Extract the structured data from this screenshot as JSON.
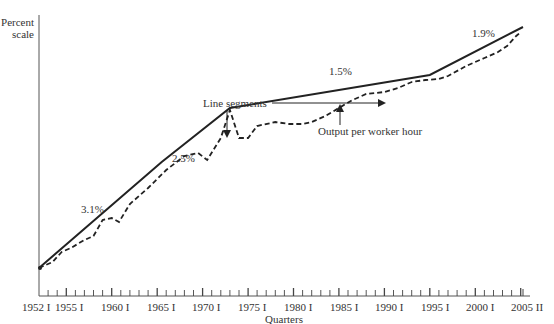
{
  "chart_data": {
    "type": "line",
    "title": "",
    "ylabel": "Percent scale",
    "xlabel": "Quarters",
    "grid": false,
    "legend": "none (inline annotations)",
    "x_tick_labels": [
      "1952 I",
      "1955 I",
      "1960 I",
      "1965 I",
      "1970 I",
      "1975 I",
      "1980 I",
      "1985 I",
      "1990 I",
      "1995 I",
      "2000 I",
      "2005 II"
    ],
    "x_range": [
      "1952 I",
      "2005 II"
    ],
    "series": [
      {
        "name": "Line segments",
        "style": "solid",
        "points": [
          {
            "x": 1952.0,
            "y_px": 268
          },
          {
            "x": 1965.5,
            "y_px": 162
          },
          {
            "x": 1973.0,
            "y_px": 108
          },
          {
            "x": 1995.0,
            "y_px": 75
          },
          {
            "x": 2005.25,
            "y_px": 27
          }
        ],
        "segment_growth_rates": [
          "3.1%",
          "2.5%",
          "1.5%",
          "1.9%"
        ]
      },
      {
        "name": "Output per worker hour",
        "style": "dashed",
        "points": [
          {
            "x": 1952.0,
            "y_px": 268
          },
          {
            "x": 1953.5,
            "y_px": 262
          },
          {
            "x": 1954.5,
            "y_px": 252
          },
          {
            "x": 1955.5,
            "y_px": 248
          },
          {
            "x": 1957.0,
            "y_px": 240
          },
          {
            "x": 1958.0,
            "y_px": 236
          },
          {
            "x": 1959.0,
            "y_px": 220
          },
          {
            "x": 1960.0,
            "y_px": 218
          },
          {
            "x": 1960.8,
            "y_px": 222
          },
          {
            "x": 1962.0,
            "y_px": 204
          },
          {
            "x": 1964.0,
            "y_px": 188
          },
          {
            "x": 1966.0,
            "y_px": 170
          },
          {
            "x": 1968.0,
            "y_px": 156
          },
          {
            "x": 1969.5,
            "y_px": 153
          },
          {
            "x": 1970.5,
            "y_px": 160
          },
          {
            "x": 1972.0,
            "y_px": 138
          },
          {
            "x": 1973.0,
            "y_px": 110
          },
          {
            "x": 1974.0,
            "y_px": 138
          },
          {
            "x": 1975.0,
            "y_px": 138
          },
          {
            "x": 1976.0,
            "y_px": 126
          },
          {
            "x": 1978.0,
            "y_px": 122
          },
          {
            "x": 1979.5,
            "y_px": 124
          },
          {
            "x": 1981.0,
            "y_px": 124
          },
          {
            "x": 1982.0,
            "y_px": 122
          },
          {
            "x": 1983.5,
            "y_px": 116
          },
          {
            "x": 1985.0,
            "y_px": 108
          },
          {
            "x": 1986.5,
            "y_px": 100
          },
          {
            "x": 1988.0,
            "y_px": 94
          },
          {
            "x": 1990.0,
            "y_px": 92
          },
          {
            "x": 1991.5,
            "y_px": 88
          },
          {
            "x": 1993.0,
            "y_px": 82
          },
          {
            "x": 1994.5,
            "y_px": 80
          },
          {
            "x": 1996.0,
            "y_px": 79
          },
          {
            "x": 1997.0,
            "y_px": 76
          },
          {
            "x": 1999.0,
            "y_px": 66
          },
          {
            "x": 2001.0,
            "y_px": 58
          },
          {
            "x": 2002.5,
            "y_px": 52
          },
          {
            "x": 2003.5,
            "y_px": 46
          },
          {
            "x": 2004.5,
            "y_px": 36
          },
          {
            "x": 2005.0,
            "y_px": 32
          }
        ]
      }
    ],
    "annotations": [
      {
        "text": "3.1%",
        "x_px": 96,
        "y_px": 206
      },
      {
        "text": "2.5%",
        "x_px": 186,
        "y_px": 156
      },
      {
        "text": "1.5%",
        "x_px": 335,
        "y_px": 72
      },
      {
        "text": "1.9%",
        "x_px": 482,
        "y_px": 36
      },
      {
        "text": "Line segments",
        "x_px": 243,
        "y_px": 108,
        "arrows": [
          "down to 1973 break",
          "right to 1985 solid line"
        ]
      },
      {
        "text": "Output per worker hour",
        "x_px": 317,
        "y_px": 138,
        "arrow": "up to dashed line near 1985"
      }
    ]
  },
  "axes": {
    "y_label_line1": "Percent",
    "y_label_line2": "scale",
    "x_label": "Quarters"
  },
  "labels": {
    "seg1": "3.1%",
    "seg2": "2.5%",
    "seg3": "1.5%",
    "seg4": "1.9%",
    "line_segments": "Line segments",
    "output_per_worker_hour": "Output per worker hour"
  },
  "ticks": {
    "t0": "1952 I",
    "t1": "1955 I",
    "t2": "1960 I",
    "t3": "1965 I",
    "t4": "1970 I",
    "t5": "1975 I",
    "t6": "1980 I",
    "t7": "1985 I",
    "t8": "1990 I",
    "t9": "1995 I",
    "t10": "2000 I",
    "t11": "2005 II"
  },
  "colors": {
    "line": "#222222",
    "axis": "#555555",
    "text": "#333333"
  }
}
